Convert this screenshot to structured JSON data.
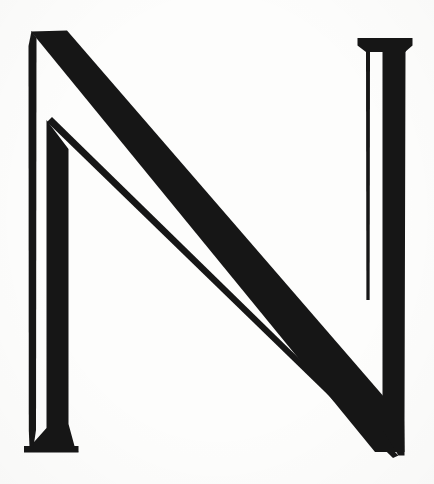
{
  "artwork": {
    "type": "letterform",
    "character": "N",
    "script": "Latin",
    "case": "uppercase",
    "style": "high-contrast didone serif",
    "description": "Decorative capital letter N rendered as a solid black high-contrast serif glyph on off-white paper",
    "width": 434,
    "height": 484,
    "background_color": "#fdfdfc",
    "ink_color": "#161616",
    "title_text": "N"
  },
  "geometry": {
    "left_stem": {
      "hairline_x": [
        29,
        34
      ],
      "thick_x": [
        46,
        68
      ],
      "foot_x": [
        24,
        78
      ],
      "foot_bottom_y": 452,
      "apex": [
        33,
        32
      ]
    },
    "right_stem": {
      "hairline_x": [
        364,
        369
      ],
      "thick_x": [
        382,
        404
      ],
      "head_x": [
        358,
        412
      ],
      "head_top_y": 38,
      "apex": [
        398,
        455
      ]
    },
    "diagonal": {
      "start": [
        33,
        32
      ],
      "end": [
        398,
        455
      ],
      "thick_span_at_y242": [
        225,
        290
      ],
      "hairline_span_at_y242": [
        172,
        184
      ]
    }
  },
  "paths": {
    "left_hairline": "M 31.5 31 L 36.5 38 L 36.0 430 L 33.5 447 L 29.5 447 L 28.8 430 L 28.5 46 Z",
    "left_thick_stem": "M 46.5 120 L 68.5 149 L 68.5 424 L 74.5 446 L 78.5 452 L 24.5 452 L 30.5 446 L 46.5 428 Z",
    "diagonal_thick": "M 31.0 31.5 L 67.0 30.5 L 404.0 420.0 L 404.5 452.0 L 375.0 452.0 Z",
    "diagonal_hairline": "M 47.0 122.0 L 52.0 117.0 L 398.5 455.5 L 393.0 458.0 Z",
    "right_hairline": "M 366.5 44.0 L 370.0 52.0 L 369.6 300.0 L 366.4 300.0 L 366.0 52.0 Z",
    "right_thick_stem": "M 358.0 38.0 L 412.0 38.0 L 405.5 52.0 L 404.5 420.0 L 404.5 455.5 L 398.5 455.5 L 382.5 430.0 L 382.5 52.0 Z",
    "right_head_slab": "M 357.5 38.0 L 412.5 38.0 L 412.5 45.5 L 405.0 52.0 L 366.0 52.0 L 357.5 45.5 Z",
    "left_foot_slab": "M 24.0 446.0 L 78.5 446.0 L 78.5 452.5 L 24.0 452.5 Z"
  }
}
